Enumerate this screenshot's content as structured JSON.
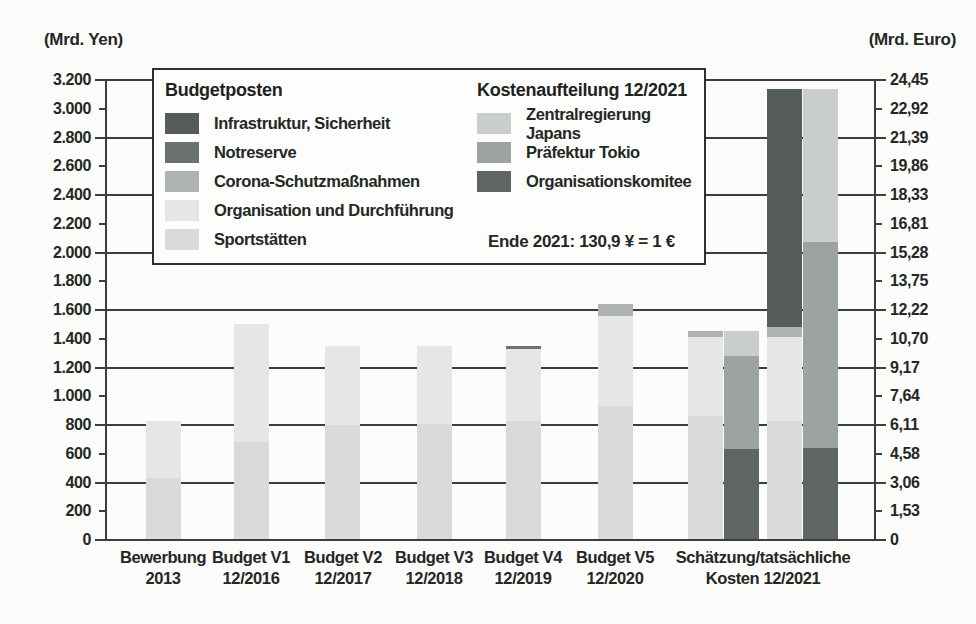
{
  "axes": {
    "left_title": "(Mrd. Yen)",
    "right_title": "(Mrd. Euro)"
  },
  "colors": {
    "infrastruktur": "#565c5b",
    "notreserve": "#6b7170",
    "corona": "#aeb3b2",
    "organisation": "#e5e7e5",
    "sportstaetten": "#d8dbda",
    "zentralregierung": "#c9cdcc",
    "praefektur": "#9da3a2",
    "komitee": "#5f6564",
    "axis_line": "#3a3e3c"
  },
  "legend": {
    "budget": {
      "title": "Budgetposten",
      "items": [
        {
          "label": "Infrastruktur, Sicherheit",
          "color": "infrastruktur"
        },
        {
          "label": "Notreserve",
          "color": "notreserve"
        },
        {
          "label": "Corona-Schutzmaßnahmen",
          "color": "corona"
        },
        {
          "label": "Organisation und Durchführung",
          "color": "organisation"
        },
        {
          "label": "Sportstätten",
          "color": "sportstaetten"
        }
      ]
    },
    "cost": {
      "title": "Kostenaufteilung 12/2021",
      "items": [
        {
          "label": "Zentralregierung Japans",
          "color": "zentralregierung"
        },
        {
          "label": "Präfektur Tokio",
          "color": "praefektur"
        },
        {
          "label": "Organisationskomitee",
          "color": "komitee"
        }
      ]
    },
    "note": "Ende 2021: 130,9 ¥ = 1 €"
  },
  "chart_data": {
    "type": "bar",
    "stacked": true,
    "unit_left": "Mrd. Yen",
    "unit_right": "Mrd. Euro",
    "ylim_left_yen": [
      0,
      3200
    ],
    "ylim_right_euro": [
      0,
      24.45
    ],
    "exchange_note": "Ende 2021: 130,9 ¥ = 1 €",
    "grid": "major horizontal every 400 Mrd. Yen",
    "bar_width": 35,
    "axis_ticks": [
      {
        "yen": 0,
        "yen_label": "0",
        "euro_label": "0",
        "major": true
      },
      {
        "yen": 200,
        "yen_label": "200",
        "euro_label": "1,53",
        "major": false
      },
      {
        "yen": 400,
        "yen_label": "400",
        "euro_label": "3,06",
        "major": true
      },
      {
        "yen": 600,
        "yen_label": "600",
        "euro_label": "4,58",
        "major": false
      },
      {
        "yen": 800,
        "yen_label": "800",
        "euro_label": "6,11",
        "major": true
      },
      {
        "yen": 1000,
        "yen_label": "1.000",
        "euro_label": "7,64",
        "major": false
      },
      {
        "yen": 1200,
        "yen_label": "1.200",
        "euro_label": "9,17",
        "major": true
      },
      {
        "yen": 1400,
        "yen_label": "1.400",
        "euro_label": "10,70",
        "major": false
      },
      {
        "yen": 1600,
        "yen_label": "1.600",
        "euro_label": "12,22",
        "major": true
      },
      {
        "yen": 1800,
        "yen_label": "1.800",
        "euro_label": "13,75",
        "major": false
      },
      {
        "yen": 2000,
        "yen_label": "2.000",
        "euro_label": "15,28",
        "major": true
      },
      {
        "yen": 2200,
        "yen_label": "2.200",
        "euro_label": "16,81",
        "major": false
      },
      {
        "yen": 2400,
        "yen_label": "2.400",
        "euro_label": "18,33",
        "major": true
      },
      {
        "yen": 2600,
        "yen_label": "2.600",
        "euro_label": "19,86",
        "major": false
      },
      {
        "yen": 2800,
        "yen_label": "2.800",
        "euro_label": "21,39",
        "major": true
      },
      {
        "yen": 3000,
        "yen_label": "3.000",
        "euro_label": "22,92",
        "major": false
      },
      {
        "yen": 3200,
        "yen_label": "3.200",
        "euro_label": "24,45",
        "major": true
      }
    ],
    "bars": [
      {
        "name": "bewerbung-2013",
        "x": 146,
        "segments": [
          {
            "label": "Sportstätten",
            "color": "sportstaetten",
            "value": 430
          },
          {
            "label": "Organisation und Durchführung",
            "color": "organisation",
            "value": 400
          }
        ]
      },
      {
        "name": "budget-v1-12-2016",
        "x": 234,
        "segments": [
          {
            "label": "Sportstätten",
            "color": "sportstaetten",
            "value": 680
          },
          {
            "label": "Organisation und Durchführung",
            "color": "organisation",
            "value": 820
          }
        ]
      },
      {
        "name": "budget-v2-12-2017",
        "x": 325,
        "segments": [
          {
            "label": "Sportstätten",
            "color": "sportstaetten",
            "value": 800
          },
          {
            "label": "Organisation und Durchführung",
            "color": "organisation",
            "value": 550
          }
        ]
      },
      {
        "name": "budget-v3-12-2018",
        "x": 417,
        "segments": [
          {
            "label": "Sportstätten",
            "color": "sportstaetten",
            "value": 810
          },
          {
            "label": "Organisation und Durchführung",
            "color": "organisation",
            "value": 540
          }
        ]
      },
      {
        "name": "budget-v4-12-2019",
        "x": 506,
        "segments": [
          {
            "label": "Sportstätten",
            "color": "sportstaetten",
            "value": 830
          },
          {
            "label": "Organisation und Durchführung",
            "color": "organisation",
            "value": 500
          },
          {
            "label": "Notreserve",
            "color": "notreserve",
            "value": 20
          }
        ]
      },
      {
        "name": "budget-v5-12-2020",
        "x": 598,
        "segments": [
          {
            "label": "Sportstätten",
            "color": "sportstaetten",
            "value": 930
          },
          {
            "label": "Organisation und Durchführung",
            "color": "organisation",
            "value": 630
          },
          {
            "label": "Corona-Schutzmaßnahmen",
            "color": "corona",
            "value": 85
          }
        ]
      },
      {
        "name": "schaetzung-12-2021-budgetposten",
        "x": 688,
        "segments": [
          {
            "label": "Sportstätten",
            "color": "sportstaetten",
            "value": 860
          },
          {
            "label": "Organisation und Durchführung",
            "color": "organisation",
            "value": 550
          },
          {
            "label": "Corona-Schutzmaßnahmen",
            "color": "corona",
            "value": 45
          }
        ]
      },
      {
        "name": "schaetzung-12-2021-kostenaufteilung",
        "x": 724,
        "segments": [
          {
            "label": "Organisationskomitee",
            "color": "komitee",
            "value": 635
          },
          {
            "label": "Präfektur Tokio",
            "color": "praefektur",
            "value": 645
          },
          {
            "label": "Zentralregierung Japans",
            "color": "zentralregierung",
            "value": 175
          }
        ]
      },
      {
        "name": "tatsaechliche-kosten-12-2021-budgetposten",
        "x": 767,
        "segments": [
          {
            "label": "Sportstätten",
            "color": "sportstaetten",
            "value": 830
          },
          {
            "label": "Organisation und Durchführung",
            "color": "organisation",
            "value": 580
          },
          {
            "label": "Corona-Schutzmaßnahmen",
            "color": "corona",
            "value": 70
          },
          {
            "label": "Infrastruktur, Sicherheit",
            "color": "infrastruktur",
            "value": 1660
          }
        ]
      },
      {
        "name": "tatsaechliche-kosten-12-2021-kostenaufteilung",
        "x": 803,
        "segments": [
          {
            "label": "Organisationskomitee",
            "color": "komitee",
            "value": 640
          },
          {
            "label": "Präfektur Tokio",
            "color": "praefektur",
            "value": 1430
          },
          {
            "label": "Zentralregierung Japans",
            "color": "zentralregierung",
            "value": 1070
          }
        ]
      }
    ],
    "x_labels": [
      {
        "x": 163,
        "lines": [
          "Bewerbung",
          "2013"
        ]
      },
      {
        "x": 251,
        "lines": [
          "Budget V1",
          "12/2016"
        ]
      },
      {
        "x": 343,
        "lines": [
          "Budget V2",
          "12/2017"
        ]
      },
      {
        "x": 434,
        "lines": [
          "Budget V3",
          "12/2018"
        ]
      },
      {
        "x": 523,
        "lines": [
          "Budget V4",
          "12/2019"
        ]
      },
      {
        "x": 615,
        "lines": [
          "Budget V5",
          "12/2020"
        ]
      },
      {
        "x": 763,
        "lines": [
          "Schätzung/tatsächliche",
          "Kosten 12/2021"
        ]
      }
    ]
  }
}
